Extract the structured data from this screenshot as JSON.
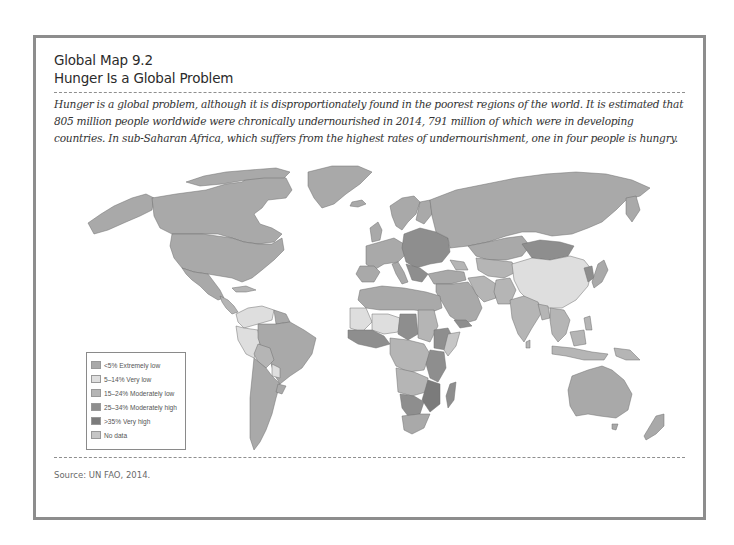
{
  "header": {
    "figure_label": "Global Map 9.2",
    "title": "Hunger Is a Global Problem"
  },
  "caption": "Hunger is a global problem, although it is disproportionately found in the poorest regions of the world. It is estimated that 805 million people worldwide were chronically undernourished in 2014, 791 million of which were in developing countries. In sub-Saharan Africa, which suffers from the highest rates of undernourishment, one in four people is hungry.",
  "source": "Source: UN FAO, 2014.",
  "legend": {
    "items": [
      {
        "label": "<5% Extremely low",
        "color": "#a9a9a9"
      },
      {
        "label": "5–14% Very low",
        "color": "#dedede"
      },
      {
        "label": "15–24% Moderately low",
        "color": "#b5b5b5"
      },
      {
        "label": "25–34% Moderately high",
        "color": "#8e8e8e"
      },
      {
        "label": ">35% Very high",
        "color": "#7b7b7b"
      },
      {
        "label": "No data",
        "color": "#c6c6c6"
      }
    ]
  },
  "colors": {
    "frame_border": "#8d8d8d",
    "ocean": "#ffffff",
    "country_border": "#6e6e6e"
  }
}
